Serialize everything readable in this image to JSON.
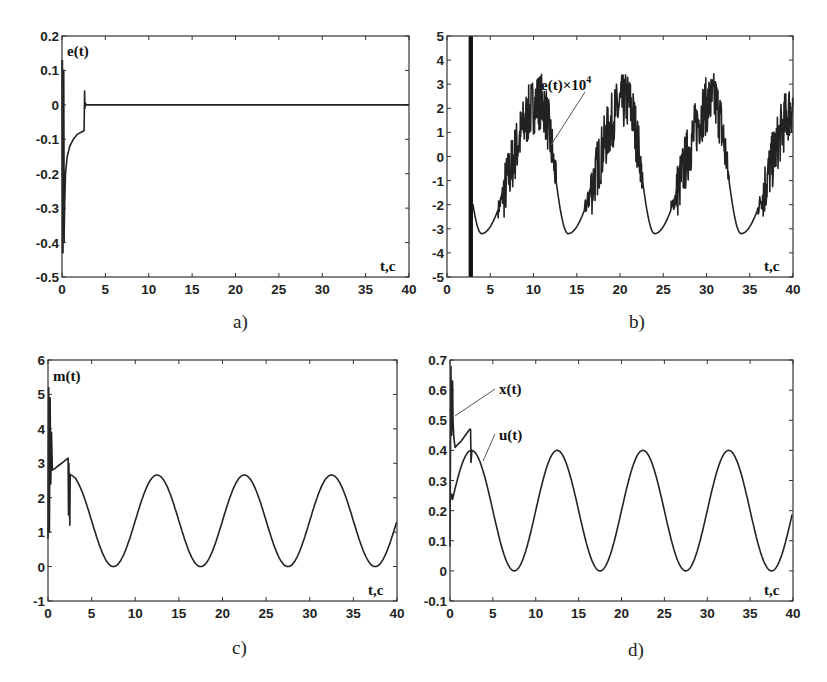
{
  "chart_data": [
    {
      "id": "a",
      "type": "line",
      "caption": "a)",
      "title": "",
      "ylabel": "e(t)",
      "xlabel": "t,c",
      "xlim": [
        0,
        40
      ],
      "ylim": [
        -0.5,
        0.2
      ],
      "xticks": [
        0,
        5,
        10,
        15,
        20,
        25,
        30,
        35,
        40
      ],
      "yticks": [
        -0.5,
        -0.4,
        -0.3,
        -0.2,
        -0.1,
        0,
        0.1,
        0.2
      ],
      "ytick_labels": [
        "-0.5",
        "-0.4",
        "-0.3",
        "-0.2",
        "-0.1",
        "0",
        "0.1",
        "0.2"
      ],
      "grid": false,
      "series": [
        {
          "name": "e(t)",
          "description": "Large transient near t=0 (spikes to about -0.43 and +0.13), recovers to about -0.08 by t≈2.5, brief spike to +0.04 at t≈2.6, then stays at 0 until t=40",
          "x": [
            0,
            0.1,
            0.2,
            0.25,
            0.3,
            0.4,
            0.6,
            0.9,
            1.3,
            1.8,
            2.3,
            2.55,
            2.6,
            2.65,
            2.7,
            2.8,
            5,
            10,
            20,
            30,
            40
          ],
          "y": [
            0.13,
            -0.43,
            0.1,
            -0.37,
            -0.3,
            -0.2,
            -0.15,
            -0.12,
            -0.1,
            -0.085,
            -0.078,
            -0.075,
            0.04,
            -0.01,
            0.005,
            0,
            0,
            0,
            0,
            0,
            0
          ]
        }
      ],
      "frame": [
        62,
        36,
        409,
        277
      ]
    },
    {
      "id": "b",
      "type": "line",
      "caption": "b)",
      "title": "",
      "ylabel": "",
      "xlabel": "t,c",
      "xlim": [
        0,
        40
      ],
      "ylim": [
        -5,
        5
      ],
      "xticks": [
        0,
        5,
        10,
        15,
        20,
        25,
        30,
        35,
        40
      ],
      "yticks": [
        -5,
        -4,
        -3,
        -2,
        -1,
        0,
        1,
        2,
        3,
        4,
        5
      ],
      "ytick_labels": [
        "-5",
        "-4",
        "-3",
        "-2",
        "-1",
        "0",
        "1",
        "2",
        "3",
        "4",
        "5"
      ],
      "grid": false,
      "annotations": [
        {
          "text": "e(t)×10⁴",
          "x": 13.5,
          "y": 4.0,
          "arrow_to": [
            12.0,
            1.8
          ]
        }
      ],
      "series": [
        {
          "name": "e(t)×10^4",
          "description": "Saturated dense band spanning full y range at t≈2.5–3; thereafter periodic (period 10) waveform with smooth troughs of about -3.2 at t≈4, 14, 24, 34 and noisy high-frequency chattering peaks up to about 3.3 near t≈11, 21, 31, 39",
          "period": 10,
          "trough_times": [
            4,
            14,
            24,
            34
          ],
          "trough_value": -3.2,
          "peak_times": [
            10.8,
            20.8,
            30.8
          ],
          "peak_value_mean": 2.2,
          "peak_value_max": 3.3,
          "saturated_band_x": [
            2.5,
            3.0
          ]
        }
      ],
      "frame": [
        447,
        36,
        793,
        277
      ]
    },
    {
      "id": "c",
      "type": "line",
      "caption": "c)",
      "title": "",
      "ylabel": "m(t)",
      "xlabel": "t,c",
      "xlim": [
        0,
        40
      ],
      "ylim": [
        -1,
        6
      ],
      "xticks": [
        0,
        5,
        10,
        15,
        20,
        25,
        30,
        35,
        40
      ],
      "yticks": [
        -1,
        0,
        1,
        2,
        3,
        4,
        5,
        6
      ],
      "ytick_labels": [
        "-1",
        "0",
        "1",
        "2",
        "3",
        "4",
        "5",
        "6"
      ],
      "grid": false,
      "series": [
        {
          "name": "m(t)",
          "description": "Transient spikes near t=0 (0.8 to 5.2), ramps from 2.8 to 3.15 by t≈2.3, drops with spike down to 1.2 at t≈2.5, then sinusoid of period 10 between 0 and 2.65 (peaks t≈12.5, 22.5, 32.5; troughs t≈7.5, 17.5, 27.5, 37.5), ends ≈1.4 at t=40",
          "sine": {
            "offset": 1.33,
            "amplitude": 1.33,
            "period": 10,
            "peak_t": 12.5
          },
          "peaks": [
            [
              12.5,
              2.65
            ],
            [
              22.5,
              2.65
            ],
            [
              32.5,
              2.65
            ]
          ],
          "troughs": [
            [
              7.5,
              0
            ],
            [
              17.5,
              0
            ],
            [
              27.5,
              0
            ],
            [
              37.5,
              0
            ]
          ]
        }
      ],
      "frame": [
        48,
        360,
        397,
        601
      ]
    },
    {
      "id": "d",
      "type": "line",
      "caption": "d)",
      "title": "",
      "ylabel": "",
      "xlabel": "t,c",
      "xlim": [
        0,
        40
      ],
      "ylim": [
        -0.1,
        0.7
      ],
      "xticks": [
        0,
        5,
        10,
        15,
        20,
        25,
        30,
        35,
        40
      ],
      "yticks": [
        -0.1,
        0,
        0.1,
        0.2,
        0.3,
        0.4,
        0.5,
        0.6,
        0.7
      ],
      "ytick_labels": [
        "-0.1",
        "0",
        "0.1",
        "0.2",
        "0.3",
        "0.4",
        "0.5",
        "0.6",
        "0.7"
      ],
      "grid": false,
      "annotations": [
        {
          "text": "x(t)",
          "x": 5.8,
          "y": 0.6,
          "arrow_to": [
            0.4,
            0.51
          ]
        },
        {
          "text": "u(t)",
          "x": 5.8,
          "y": 0.45,
          "arrow_to": [
            3.6,
            0.35
          ]
        }
      ],
      "series": [
        {
          "name": "x(t)",
          "description": "Transient spikes near t=0 up to 0.68, dips to 0.41 at t≈0.6, rises to 0.47 at t≈2.3, drops to 0.36 at t≈2.5 then merges with u(t)",
          "x": [
            0,
            0.1,
            0.2,
            0.3,
            0.35,
            0.45,
            0.6,
            0.9,
            1.3,
            1.8,
            2.3,
            2.4,
            2.45,
            2.55
          ],
          "y": [
            0.08,
            0.68,
            0.45,
            0.63,
            0.5,
            0.44,
            0.41,
            0.42,
            0.43,
            0.45,
            0.47,
            0.47,
            0.36,
            0.4
          ]
        },
        {
          "name": "u(t)",
          "description": "Sinusoid of period 10 between 0 and 0.4 starting at ≈0.23 at t=0, peaks at t≈2.5, 12.5, 22.5, 32.5; troughs at t≈7.5, 17.5, 27.5, 37.5; ends at ≈0.2 at t=40",
          "sine": {
            "offset": 0.2,
            "amplitude": 0.2,
            "period": 10,
            "peak_t": 12.5
          },
          "peaks": [
            [
              2.5,
              0.4
            ],
            [
              12.5,
              0.4
            ],
            [
              22.5,
              0.4
            ],
            [
              32.5,
              0.4
            ]
          ],
          "troughs": [
            [
              7.5,
              0
            ],
            [
              17.5,
              0
            ],
            [
              27.5,
              0
            ],
            [
              37.5,
              0
            ]
          ]
        }
      ],
      "frame": [
        450,
        360,
        793,
        601
      ]
    }
  ],
  "captions": {
    "a": "a)",
    "b": "b)",
    "c": "c)",
    "d": "d)"
  },
  "labels": {
    "a_y": "e(t)",
    "a_x": "t,c",
    "b_annot": "e(t)×10",
    "b_annot_exp": "4",
    "b_x": "t,c",
    "c_y": "m(t)",
    "c_x": "t,c",
    "d_x_annot": "x(t)",
    "d_u_annot": "u(t)",
    "d_x": "t,c"
  }
}
